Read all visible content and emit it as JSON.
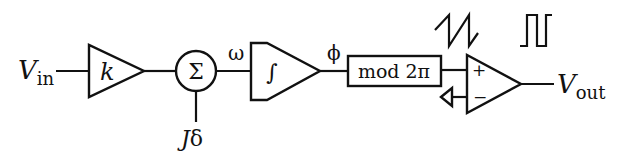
{
  "diagram": {
    "input_label": {
      "main": "V",
      "sub": "in"
    },
    "gain_label": "k",
    "summer_label": "Σ",
    "summer_input_label": {
      "main": "J",
      "rest": "δ"
    },
    "omega_label": "ω",
    "integrator_label": "∫",
    "phi_label": "ϕ",
    "mod_block_label": "mod 2π",
    "comparator_plus": "+",
    "comparator_minus": "−",
    "output_label": {
      "main": "V",
      "sub": "out"
    },
    "waveforms": [
      "sawtooth",
      "square"
    ]
  }
}
